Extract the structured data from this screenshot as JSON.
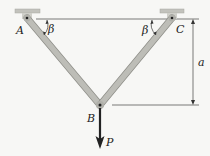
{
  "diagram": {
    "type": "two-bar truss",
    "labels": {
      "A": "A",
      "B": "B",
      "C": "C",
      "angle_left": "β",
      "angle_right": "β",
      "dimension": "a",
      "load": "P"
    },
    "colors": {
      "bar": "#b9b9b3",
      "bar_edge": "#8f8f89",
      "support": "#c2c2bc",
      "line": "#333333",
      "background": "#f7f7f5"
    }
  }
}
